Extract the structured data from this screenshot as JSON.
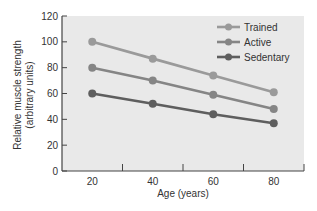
{
  "chart_data": {
    "type": "line",
    "title": "",
    "xlabel": "Age (years)",
    "ylabel_line1": "Relative muscle strength",
    "ylabel_line2": "(arbitrary units)",
    "x": [
      20,
      40,
      60,
      80
    ],
    "xlim": [
      10,
      90
    ],
    "ylim": [
      0,
      120
    ],
    "x_ticks": [
      20,
      40,
      60,
      80
    ],
    "x_minor_ticks": [
      30,
      50,
      70,
      90
    ],
    "y_ticks": [
      0,
      20,
      40,
      60,
      80,
      100,
      120
    ],
    "grid": false,
    "legend_position": "upper right",
    "series": [
      {
        "name": "Trained",
        "values": [
          100,
          87,
          74,
          61
        ],
        "color": "#9a9a9a"
      },
      {
        "name": "Active",
        "values": [
          80,
          70,
          59,
          48
        ],
        "color": "#858585"
      },
      {
        "name": "Sedentary",
        "values": [
          60,
          52,
          44,
          37
        ],
        "color": "#5e5e5e"
      }
    ],
    "plot_background": "#e9e9e9"
  }
}
